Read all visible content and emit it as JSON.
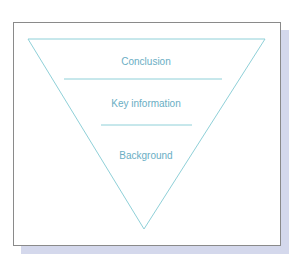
{
  "diagram": {
    "type": "inverted-pyramid",
    "layers": [
      {
        "label": "Conclusion"
      },
      {
        "label": "Key information"
      },
      {
        "label": "Background"
      }
    ],
    "colors": {
      "outline": "#8fd0d8",
      "text": "#6aaec4",
      "frame_border": "#8a8a8a",
      "shadow": "#d4d8ec"
    }
  }
}
